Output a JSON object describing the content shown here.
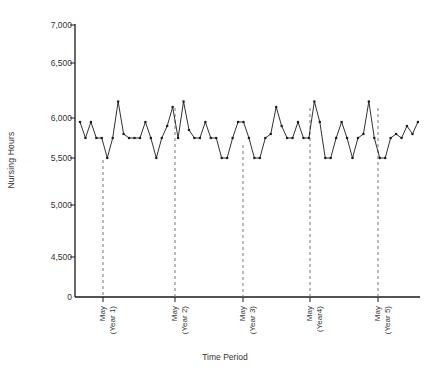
{
  "chart_data": {
    "type": "line",
    "title": "",
    "subtitle": "",
    "xlabel": "Time Period",
    "ylabel": "Nursing Hours",
    "ylim": [
      0,
      7000
    ],
    "y_ticks": [
      0,
      4500,
      5000,
      5500,
      6000,
      6500,
      7000
    ],
    "y_tick_labels": [
      "0",
      "4,500",
      "5,000",
      "5,500",
      "6,000",
      "6,500",
      "7,000"
    ],
    "y_axis_note": "axis has a break between 0 and 4,500 (0 baseline drawn below 4,500 with compressed spacing)",
    "grid": false,
    "legend": null,
    "marker": "square-dot",
    "line_style": "solid",
    "color": "#1a1a1a",
    "x_markers": [
      {
        "label_line1": "May",
        "label_line2": "(Year 1)",
        "x_index": 6
      },
      {
        "label_line1": "May",
        "label_line2": "(Year 2)",
        "x_index": 18
      },
      {
        "label_line1": "May",
        "label_line2": "(Year 3)",
        "x_index": 29
      },
      {
        "label_line1": "May",
        "label_line2": "(Year4)",
        "x_index": 41
      },
      {
        "label_line1": "May",
        "label_line2": "(Year 5)",
        "x_index": 53
      },
      {
        "label_line1": "",
        "label_line2": "",
        "x_index": 65
      }
    ],
    "x": [
      0,
      1,
      2,
      3,
      4,
      5,
      6,
      7,
      8,
      9,
      10,
      11,
      12,
      13,
      14,
      15,
      16,
      17,
      18,
      19,
      20,
      21,
      22,
      23,
      24,
      25,
      26,
      27,
      28,
      29,
      30,
      31,
      32,
      33,
      34,
      35,
      36,
      37,
      38,
      39,
      40,
      41,
      42,
      43,
      44,
      45,
      46,
      47,
      48,
      49,
      50,
      51,
      52,
      53,
      54,
      55,
      56,
      57,
      58,
      59,
      60,
      61,
      62
    ],
    "values": [
      5950,
      5750,
      5950,
      5750,
      5750,
      5500,
      5750,
      6150,
      5800,
      5750,
      5750,
      5750,
      5950,
      5750,
      5500,
      5750,
      5900,
      6100,
      5750,
      6150,
      5850,
      5750,
      5750,
      5950,
      5750,
      5750,
      5500,
      5500,
      5750,
      5950,
      5950,
      5750,
      5500,
      5500,
      5750,
      5800,
      6100,
      5900,
      5750,
      5750,
      5950,
      5750,
      5750,
      6150,
      5950,
      5500,
      5500,
      5750,
      5950,
      5750,
      5500,
      5750,
      5800,
      6150,
      5750,
      5500,
      5500,
      5750,
      5800,
      5750,
      5900,
      5800,
      5950
    ]
  }
}
